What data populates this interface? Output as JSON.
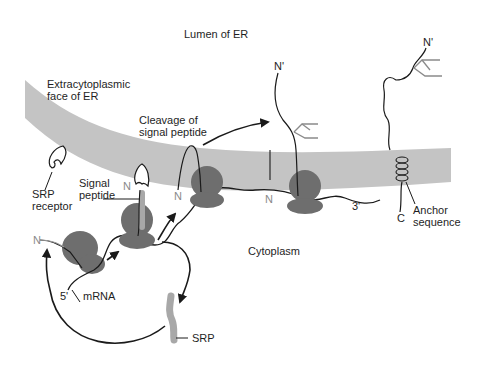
{
  "figure": {
    "type": "biology-diagram",
    "colors": {
      "background": "#ffffff",
      "membrane": "#c4c4c4",
      "ribosome": "#6e6e6e",
      "signal_peptide_srp": "#a8a8a8",
      "chain_line": "#1a1a1a",
      "sugar_branches": "#8a8a8a",
      "text": "#1e1e1e"
    }
  },
  "regions": {
    "lumen": "Lumen of ER",
    "cytoplasm": "Cytoplasm",
    "extracytoplasmic_line1": "Extracytoplasmic",
    "extracytoplasmic_line2": "face of ER"
  },
  "labels": {
    "srp_receptor_line1": "SRP",
    "srp_receptor_line2": "receptor",
    "signal_peptide_line1": "Signal",
    "signal_peptide_line2": "peptide",
    "cleavage_line1": "Cleavage of",
    "cleavage_line2": "signal peptide",
    "mrna": "mRNA",
    "five_prime": "5'",
    "three_prime": "3'",
    "srp": "SRP",
    "anchor_line1": "Anchor",
    "anchor_line2": "sequence",
    "n_terminus_1": "N",
    "n_terminus_2": "N",
    "n_terminus_3": "N",
    "n_terminus_4": "N",
    "n_prime_1": "N'",
    "n_prime_2": "N'",
    "c_terminus": "C"
  },
  "stages": [
    "Ribosome translating mRNA, N-terminus emerging",
    "SRP binds signal peptide; complex docks at SRP receptor",
    "Nascent chain inserted into membrane as loop",
    "Signal peptide cleaved; chain continues into lumen with glycosylation",
    "Mature protein with anchor sequence spanning membrane, C-terminus in cytoplasm"
  ]
}
